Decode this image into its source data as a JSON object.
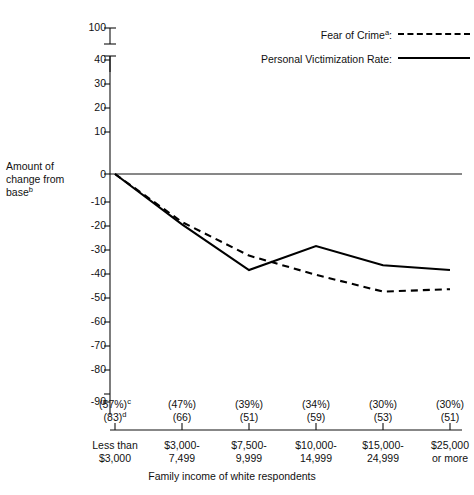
{
  "chart_data": {
    "type": "line",
    "title": "",
    "xlabel": "Family income of white respondents",
    "ylabel": "Amount of change from base",
    "ylabel_footnote": "b",
    "categories": [
      "Less than $3,000",
      "$3,000-7,499",
      "$7,500-9,999",
      "$10,000-14,999",
      "$15,000-24,999",
      "$25,000 or more"
    ],
    "ylim": [
      -90,
      40
    ],
    "ytick_labels": [
      "100",
      "40",
      "30",
      "20",
      "10",
      "0",
      "-10",
      "-20",
      "-30",
      "-40",
      "-50",
      "-60",
      "-70",
      "-80",
      "-90"
    ],
    "axis_break": true,
    "grid": false,
    "legend_position": "top-right",
    "series": [
      {
        "name": "Fear of Crime",
        "footnote": "a",
        "style": "dashed",
        "values": [
          0,
          -20,
          -34,
          -42,
          -49,
          -48
        ]
      },
      {
        "name": "Personal Victimization Rate",
        "footnote": "",
        "style": "solid",
        "values": [
          0,
          -21,
          -40,
          -30,
          -38,
          -40
        ]
      }
    ],
    "annotations": {
      "percent_row": [
        "(57%)",
        "(47%)",
        "(39%)",
        "(34%)",
        "(30%)",
        "(30%)"
      ],
      "percent_footnote": "c",
      "count_row": [
        "(83)",
        "(66)",
        "(51)",
        "(59)",
        "(53)",
        "(51)"
      ],
      "count_footnote": "d"
    }
  },
  "axis": {
    "y_title_line1": "Amount of",
    "y_title_line2": "change from",
    "y_title_line3": "base",
    "y_title_sup": "b",
    "x_title": "Family income of white respondents"
  },
  "legend": {
    "items": [
      {
        "label": "Fear of Crime",
        "sup": "a",
        "suffix": ":",
        "style": "dashed"
      },
      {
        "label": "Personal Victimization Rate",
        "sup": "",
        "suffix": ":",
        "style": "solid"
      }
    ]
  },
  "ticks": {
    "y": [
      "100",
      "40",
      "30",
      "20",
      "10",
      "0",
      "-10",
      "-20",
      "-30",
      "-40",
      "-50",
      "-60",
      "-70",
      "-80",
      "-90"
    ]
  },
  "categories": [
    {
      "pct": "(57%)",
      "pct_sup": "c",
      "count": "(83)",
      "count_sup": "d",
      "line1": "Less than",
      "line2": "$3,000"
    },
    {
      "pct": "(47%)",
      "pct_sup": "",
      "count": "(66)",
      "count_sup": "",
      "line1": "$3,000-",
      "line2": "7,499"
    },
    {
      "pct": "(39%)",
      "pct_sup": "",
      "count": "(51)",
      "count_sup": "",
      "line1": "$7,500-",
      "line2": "9,999"
    },
    {
      "pct": "(34%)",
      "pct_sup": "",
      "count": "(59)",
      "count_sup": "",
      "line1": "$10,000-",
      "line2": "14,999"
    },
    {
      "pct": "(30%)",
      "pct_sup": "",
      "count": "(53)",
      "count_sup": "",
      "line1": "$15,000-",
      "line2": "24,999"
    },
    {
      "pct": "(30%)",
      "pct_sup": "",
      "count": "(51)",
      "count_sup": "",
      "line1": "$25,000",
      "line2": "or more"
    }
  ],
  "colors": {
    "ink": "#111111",
    "line": "#000000",
    "background": "#ffffff"
  }
}
